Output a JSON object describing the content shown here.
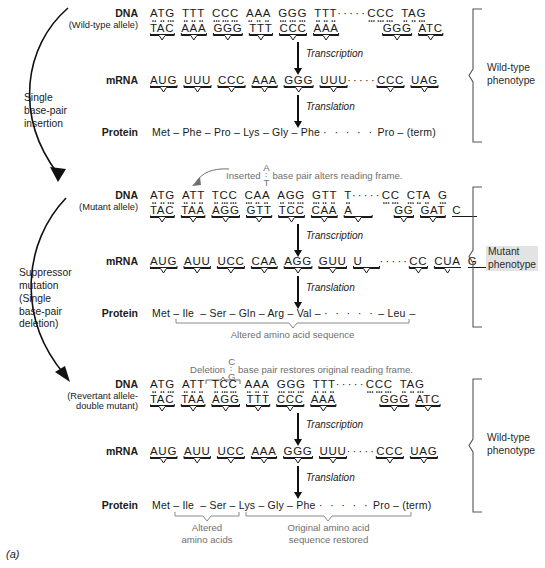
{
  "figure": {
    "label": "(a)",
    "caption_title": "Frameshift mutation and suppressor reversion"
  },
  "process_labels": {
    "transcription": "Transcription",
    "translation": "Translation"
  },
  "row_names": {
    "dna": "DNA",
    "mrna": "mRNA",
    "protein": "Protein"
  },
  "side_arrows": [
    {
      "name": "single-base-pair-insertion",
      "lines": [
        "Single",
        "base-pair",
        "insertion"
      ]
    },
    {
      "name": "suppressor-mutation",
      "lines": [
        "Suppressor",
        "mutation",
        "(Single",
        "base-pair",
        "deletion)"
      ]
    }
  ],
  "panels": [
    {
      "id": "wild-type",
      "allele": "(Wild-type allele)",
      "phenotype": [
        "Wild-type",
        "phenotype"
      ],
      "phenotype_highlight": false,
      "dna_top": [
        "ATG",
        "TTT",
        "CCC",
        "AAA",
        "GGG",
        "TTT",
        "·····",
        "CCC",
        "TAG"
      ],
      "dna_bottom": [
        "TAC",
        "AAA",
        "GGG",
        "TTT",
        "CCC",
        "AAA",
        "",
        "GGG",
        "ATC"
      ],
      "mrna": [
        "AUG",
        "UUU",
        "CCC",
        "AAA",
        "GGG",
        "UUU",
        "·····",
        "CCC",
        "UAG"
      ],
      "protein": [
        "Met",
        "Phe",
        "Pro",
        "Lys",
        "Gly",
        "Phe",
        "· · · · ·",
        "Pro",
        "(term)"
      ],
      "protein_joiners": [
        "–",
        "–",
        "–",
        "–",
        "–",
        "",
        "",
        "–"
      ]
    },
    {
      "id": "mutant",
      "allele": "(Mutant allele)",
      "phenotype": [
        "Mutant",
        "phenotype"
      ],
      "phenotype_highlight": true,
      "annotation": {
        "prefix": "Inserted",
        "top_base": "A",
        "bottom_base": "T",
        "suffix": "base pair alters reading frame."
      },
      "dna_top": [
        "ATG",
        "ATT",
        "TCC",
        "CAA",
        "AGG",
        "GTT",
        "T",
        "·····",
        "CC",
        "CTA",
        "G"
      ],
      "dna_bottom": [
        "TAC",
        "TAA",
        "AGG",
        "GTT",
        "TCC",
        "CAA",
        "A",
        "",
        "GG",
        "GAT",
        "C"
      ],
      "mrna": [
        "AUG",
        "AUU",
        "UCC",
        "CAA",
        "AGG",
        "GUU",
        "U",
        "·····",
        "CC",
        "CUA",
        "G"
      ],
      "protein": [
        "Met",
        "Ile",
        "Ser",
        "Gln",
        "Arg",
        "Val",
        "· · · · ·",
        "Leu"
      ],
      "protein_trailing": "–",
      "brace_label": "Altered amino acid sequence"
    },
    {
      "id": "revertant",
      "allele_line1": "(Revertant allele-",
      "allele_line2": "double mutant)",
      "phenotype": [
        "Wild-type",
        "phenotype"
      ],
      "phenotype_highlight": false,
      "annotation": {
        "prefix": "Deletion",
        "top_base": "C",
        "bottom_base": "G",
        "suffix": "base pair restores original reading frame."
      },
      "dna_top": [
        "ATG",
        "ATT",
        "TCC",
        "AAA",
        "GGG",
        "TTT",
        "·····",
        "CCC",
        "TAG"
      ],
      "dna_bottom": [
        "TAC",
        "TAA",
        "AGG",
        "TTT",
        "CCC",
        "AAA",
        "",
        "GGG",
        "ATC"
      ],
      "mrna": [
        "AUG",
        "AUU",
        "UCC",
        "AAA",
        "GGG",
        "UUU",
        "·····",
        "CCC",
        "UAG"
      ],
      "protein": [
        "Met",
        "Ile",
        "Ser",
        "Lys",
        "Gly",
        "Phe",
        "· · · · ·",
        "Pro",
        "(term)"
      ],
      "brace_label_left": [
        "Altered",
        "amino acids"
      ],
      "brace_label_right": [
        "Original amino acid",
        "sequence restored"
      ]
    }
  ],
  "colors": {
    "ink": "#1a1a1a",
    "annotation_gray": "#6f6f6f",
    "highlight": "#e3e3e3",
    "bracket": "#555555"
  }
}
